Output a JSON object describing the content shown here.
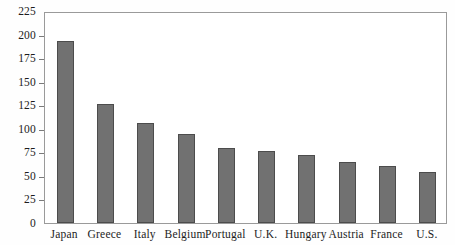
{
  "chart_data": {
    "type": "bar",
    "title": "",
    "subtitle": "",
    "xlabel": "",
    "ylabel": "",
    "categories": [
      "Japan",
      "Greece",
      "Italy",
      "Belgium",
      "Portugal",
      "U.K.",
      "Hungary",
      "Austria",
      "France",
      "U.S."
    ],
    "values": [
      193,
      126,
      106,
      95,
      80,
      76,
      72,
      65,
      61,
      54
    ],
    "ylim": [
      0,
      225
    ],
    "yticks": [
      0,
      25,
      50,
      75,
      100,
      125,
      150,
      175,
      200,
      225
    ],
    "ytick_labels": [
      "0",
      "25",
      "50",
      "75",
      "100",
      "125",
      "150",
      "175",
      "200",
      "225"
    ],
    "grid": false,
    "legend": null,
    "bar_color": "#717171",
    "bar_edge_color": "#4c4c4c",
    "frame_color": "#9a9a9a",
    "background_color": "#ffffff",
    "annotations": []
  }
}
